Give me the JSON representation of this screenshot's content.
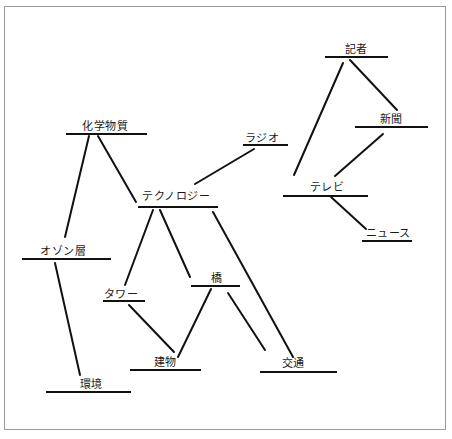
{
  "diagram": {
    "type": "concept-map",
    "colors": {
      "line": "#111111",
      "text": "#1a1a1a",
      "border": "#9a9a9a",
      "background": "#ffffff"
    },
    "nodes": [
      {
        "id": "chemicals",
        "label": "化学物質",
        "tx": 105,
        "ty": 121,
        "x1": 66,
        "x2": 147,
        "y": 134
      },
      {
        "id": "technology",
        "label": "テクノロジー",
        "tx": 176,
        "ty": 191,
        "x1": 138,
        "x2": 218,
        "y": 207
      },
      {
        "id": "radio",
        "label": "ラジオ",
        "tx": 262,
        "ty": 133,
        "x1": 243,
        "x2": 288,
        "y": 145
      },
      {
        "id": "reporter",
        "label": "記者",
        "tx": 356,
        "ty": 44,
        "x1": 325,
        "x2": 388,
        "y": 57
      },
      {
        "id": "newspaper",
        "label": "新聞",
        "tx": 391,
        "ty": 114,
        "x1": 355,
        "x2": 428,
        "y": 127
      },
      {
        "id": "tv",
        "label": "テレビ",
        "tx": 327,
        "ty": 182,
        "x1": 283,
        "x2": 368,
        "y": 196
      },
      {
        "id": "news",
        "label": "ニュース",
        "tx": 388,
        "ty": 228,
        "x1": 362,
        "x2": 412,
        "y": 241
      },
      {
        "id": "ozone",
        "label": "オゾン層",
        "tx": 63,
        "ty": 246,
        "x1": 22,
        "x2": 111,
        "y": 259
      },
      {
        "id": "tower",
        "label": "タワー",
        "tx": 121,
        "ty": 289,
        "x1": 103,
        "x2": 145,
        "y": 301
      },
      {
        "id": "bridge",
        "label": "橋",
        "tx": 217,
        "ty": 273,
        "x1": 191,
        "x2": 240,
        "y": 286
      },
      {
        "id": "building",
        "label": "建物",
        "tx": 165,
        "ty": 357,
        "x1": 130,
        "x2": 201,
        "y": 370
      },
      {
        "id": "environment",
        "label": "環境",
        "tx": 91,
        "ty": 379,
        "x1": 46,
        "x2": 131,
        "y": 392
      },
      {
        "id": "traffic",
        "label": "交通",
        "tx": 293,
        "ty": 358,
        "x1": 260,
        "x2": 337,
        "y": 372
      }
    ],
    "links": [
      {
        "from": "chemicals",
        "to": "ozone",
        "x1": 89,
        "y1": 136,
        "x2": 65,
        "y2": 237
      },
      {
        "from": "chemicals",
        "to": "technology",
        "x1": 98,
        "y1": 136,
        "x2": 136,
        "y2": 202
      },
      {
        "from": "ozone",
        "to": "environment",
        "x1": 55,
        "y1": 263,
        "x2": 80,
        "y2": 375
      },
      {
        "from": "technology",
        "to": "radio",
        "x1": 195,
        "y1": 184,
        "x2": 254,
        "y2": 149
      },
      {
        "from": "technology",
        "to": "tower",
        "x1": 153,
        "y1": 210,
        "x2": 125,
        "y2": 285
      },
      {
        "from": "technology",
        "to": "bridge",
        "x1": 160,
        "y1": 210,
        "x2": 190,
        "y2": 277
      },
      {
        "from": "technology",
        "to": "traffic",
        "x1": 213,
        "y1": 212,
        "x2": 293,
        "y2": 357
      },
      {
        "from": "tower",
        "to": "building",
        "x1": 129,
        "y1": 305,
        "x2": 174,
        "y2": 352
      },
      {
        "from": "bridge",
        "to": "building",
        "x1": 211,
        "y1": 289,
        "x2": 178,
        "y2": 357
      },
      {
        "from": "bridge",
        "to": "traffic",
        "x1": 228,
        "y1": 293,
        "x2": 265,
        "y2": 350
      },
      {
        "from": "reporter",
        "to": "tv",
        "x1": 343,
        "y1": 63,
        "x2": 294,
        "y2": 175
      },
      {
        "from": "reporter",
        "to": "newspaper",
        "x1": 350,
        "y1": 60,
        "x2": 397,
        "y2": 110
      },
      {
        "from": "newspaper",
        "to": "tv",
        "x1": 383,
        "y1": 134,
        "x2": 335,
        "y2": 176
      },
      {
        "from": "tv",
        "to": "news",
        "x1": 331,
        "y1": 197,
        "x2": 366,
        "y2": 229
      }
    ]
  }
}
